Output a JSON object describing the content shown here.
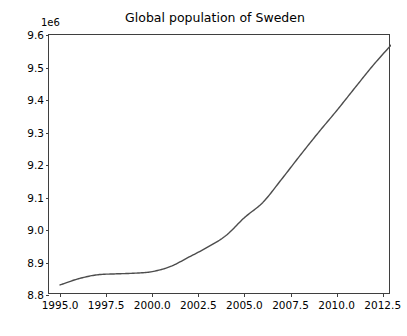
{
  "chart_data": {
    "type": "line",
    "title": "Global population of Sweden",
    "xlabel": "",
    "ylabel": "",
    "y_offset_label": "1e6",
    "grid": false,
    "legend": null,
    "xlim": [
      1994.4,
      1993.0
    ],
    "xlim_actual": [
      1994.4,
      2012.95
    ],
    "ylim": [
      8800000,
      9600000
    ],
    "xticks": [
      1995.0,
      1997.5,
      2000.0,
      2002.5,
      2005.0,
      2007.5,
      2010.0,
      2012.5
    ],
    "xtick_labels": [
      "1995.0",
      "1997.5",
      "2000.0",
      "2002.5",
      "2005.0",
      "2007.5",
      "2010.0",
      "2012.5"
    ],
    "yticks": [
      8800000,
      8900000,
      9000000,
      9100000,
      9200000,
      9300000,
      9400000,
      9500000,
      9600000
    ],
    "ytick_labels": [
      "8.8",
      "8.9",
      "9.0",
      "9.1",
      "9.2",
      "9.3",
      "9.4",
      "9.5",
      "9.6"
    ],
    "line_color": "#4d4d4d",
    "line_width": 1.4,
    "series": [
      {
        "name": "Population of Sweden",
        "x": [
          1995,
          1996,
          1997,
          1998,
          1999,
          2000,
          2001,
          2002,
          2003,
          2004,
          2005,
          2006,
          2007,
          2008,
          2009,
          2010,
          2011,
          2012,
          2013
        ],
        "values": [
          8831000,
          8850000,
          8862000,
          8865000,
          8867000,
          8872000,
          8888000,
          8917000,
          8947000,
          8983000,
          9038000,
          9085000,
          9155000,
          9228000,
          9299000,
          9367000,
          9438000,
          9508000,
          9572000
        ]
      }
    ]
  },
  "figure": {
    "background_color": "#ffffff",
    "axes_edge_color": "#3f3f3f"
  }
}
